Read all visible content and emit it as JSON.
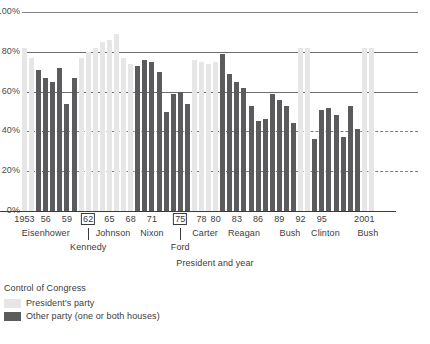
{
  "chart_data": {
    "type": "bar",
    "title": "",
    "xlabel": "President and year",
    "ylabel": "",
    "ylim": [
      0,
      100
    ],
    "y_unit": "%",
    "grid": true,
    "legend_position": "below-left",
    "y_ticks": [
      "0%",
      "20%",
      "40%",
      "60%",
      "80%",
      "100%"
    ],
    "y_tick_values": [
      0,
      20,
      40,
      60,
      80,
      100
    ],
    "x_tick_labels": [
      "1953",
      "56",
      "59",
      "62",
      "65",
      "68",
      "71",
      "75",
      "78",
      "80",
      "83",
      "86",
      "89",
      "92",
      "95",
      "2001"
    ],
    "x_tick_years": [
      1953,
      1956,
      1959,
      1962,
      1965,
      1968,
      1971,
      1975,
      1978,
      1980,
      1983,
      1986,
      1989,
      1992,
      1995,
      2001
    ],
    "x_tick_boxed": [
      false,
      false,
      false,
      true,
      false,
      false,
      false,
      true,
      false,
      false,
      false,
      false,
      false,
      false,
      false,
      false
    ],
    "presidents": [
      {
        "name": "Eisenhower",
        "center_year": 1956,
        "row": "upper"
      },
      {
        "name": "Kennedy",
        "center_year": 1962,
        "row": "lower"
      },
      {
        "name": "Johnson",
        "center_year": 1965.5,
        "row": "upper"
      },
      {
        "name": "Nixon",
        "center_year": 1971,
        "row": "upper"
      },
      {
        "name": "Ford",
        "center_year": 1975,
        "row": "lower"
      },
      {
        "name": "Carter",
        "center_year": 1978.5,
        "row": "upper"
      },
      {
        "name": "Reagan",
        "center_year": 1984,
        "row": "upper"
      },
      {
        "name": "Bush",
        "center_year": 1990.5,
        "row": "upper"
      },
      {
        "name": "Clinton",
        "center_year": 1995.5,
        "row": "upper"
      },
      {
        "name": "Bush",
        "center_year": 2001.5,
        "row": "upper"
      }
    ],
    "series": [
      {
        "name": "President's party",
        "key": "pres",
        "color": "#e6e6e6"
      },
      {
        "name": "Other party (one or both houses)",
        "key": "other",
        "color": "#5b5b5d"
      }
    ],
    "categories": [
      1953,
      1954,
      1955,
      1956,
      1957,
      1958,
      1959,
      1960,
      1961,
      1962,
      1963,
      1964,
      1965,
      1966,
      1967,
      1968,
      1969,
      1970,
      1971,
      1972,
      1973,
      1974,
      1975,
      1976,
      1977,
      1978,
      1979,
      1980,
      1981,
      1982,
      1983,
      1984,
      1985,
      1986,
      1987,
      1988,
      1989,
      1990,
      1991,
      1992,
      1993,
      1994,
      1995,
      1996,
      1997,
      1998,
      1999,
      2000,
      2001,
      2002
    ],
    "bars": [
      {
        "year": 1953,
        "value": 82,
        "control": "pres"
      },
      {
        "year": 1954,
        "value": 77,
        "control": "pres"
      },
      {
        "year": 1955,
        "value": 71,
        "control": "other"
      },
      {
        "year": 1956,
        "value": 67,
        "control": "other"
      },
      {
        "year": 1957,
        "value": 65,
        "control": "other"
      },
      {
        "year": 1958,
        "value": 72,
        "control": "other"
      },
      {
        "year": 1959,
        "value": 54,
        "control": "other"
      },
      {
        "year": 1960,
        "value": 67,
        "control": "other"
      },
      {
        "year": 1961,
        "value": 77,
        "control": "pres"
      },
      {
        "year": 1962,
        "value": 80,
        "control": "pres"
      },
      {
        "year": 1963,
        "value": 82,
        "control": "pres"
      },
      {
        "year": 1964,
        "value": 85,
        "control": "pres"
      },
      {
        "year": 1965,
        "value": 86,
        "control": "pres"
      },
      {
        "year": 1966,
        "value": 89,
        "control": "pres"
      },
      {
        "year": 1967,
        "value": 77,
        "control": "pres"
      },
      {
        "year": 1968,
        "value": 74,
        "control": "pres"
      },
      {
        "year": 1969,
        "value": 73,
        "control": "other"
      },
      {
        "year": 1970,
        "value": 76,
        "control": "other"
      },
      {
        "year": 1971,
        "value": 75,
        "control": "other"
      },
      {
        "year": 1972,
        "value": 70,
        "control": "other"
      },
      {
        "year": 1973,
        "value": 50,
        "control": "other"
      },
      {
        "year": 1974,
        "value": 59,
        "control": "other"
      },
      {
        "year": 1975,
        "value": 60,
        "control": "other"
      },
      {
        "year": 1976,
        "value": 54,
        "control": "other"
      },
      {
        "year": 1977,
        "value": 76,
        "control": "pres"
      },
      {
        "year": 1978,
        "value": 75,
        "control": "pres"
      },
      {
        "year": 1979,
        "value": 74,
        "control": "pres"
      },
      {
        "year": 1980,
        "value": 75,
        "control": "pres"
      },
      {
        "year": 1981,
        "value": 79,
        "control": "other"
      },
      {
        "year": 1982,
        "value": 69,
        "control": "other"
      },
      {
        "year": 1983,
        "value": 65,
        "control": "other"
      },
      {
        "year": 1984,
        "value": 62,
        "control": "other"
      },
      {
        "year": 1985,
        "value": 53,
        "control": "other"
      },
      {
        "year": 1986,
        "value": 45,
        "control": "other"
      },
      {
        "year": 1987,
        "value": 46,
        "control": "other"
      },
      {
        "year": 1988,
        "value": 59,
        "control": "other"
      },
      {
        "year": 1989,
        "value": 56,
        "control": "other"
      },
      {
        "year": 1990,
        "value": 53,
        "control": "other"
      },
      {
        "year": 1991,
        "value": 44,
        "control": "other"
      },
      {
        "year": 1992,
        "value": 82,
        "control": "pres"
      },
      {
        "year": 1993,
        "value": 82,
        "control": "pres"
      },
      {
        "year": 1994,
        "value": 36,
        "control": "other"
      },
      {
        "year": 1995,
        "value": 51,
        "control": "other"
      },
      {
        "year": 1996,
        "value": 52,
        "control": "other"
      },
      {
        "year": 1997,
        "value": 48,
        "control": "other"
      },
      {
        "year": 1998,
        "value": 37,
        "control": "other"
      },
      {
        "year": 1999,
        "value": 53,
        "control": "other"
      },
      {
        "year": 2000,
        "value": 41,
        "control": "other"
      },
      {
        "year": 2001,
        "value": 82,
        "control": "pres"
      },
      {
        "year": 2002,
        "value": 82,
        "control": "pres"
      }
    ]
  },
  "legend": {
    "title": "Control of Congress",
    "items": [
      {
        "label": "President's party",
        "key": "pres"
      },
      {
        "label": "Other party (one or both houses)",
        "key": "other"
      }
    ]
  }
}
